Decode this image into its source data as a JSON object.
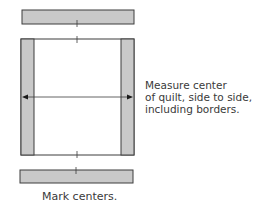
{
  "diagram": {
    "colors": {
      "strip_fill": "#c9c9c9",
      "outline": "#3d3d3d",
      "quilt_fill": "#ffffff"
    },
    "annotations": {
      "measure_line1": "Measure center",
      "measure_line2": "of quilt, side to side,",
      "measure_line3": "including borders.",
      "mark_centers": "Mark centers."
    }
  }
}
